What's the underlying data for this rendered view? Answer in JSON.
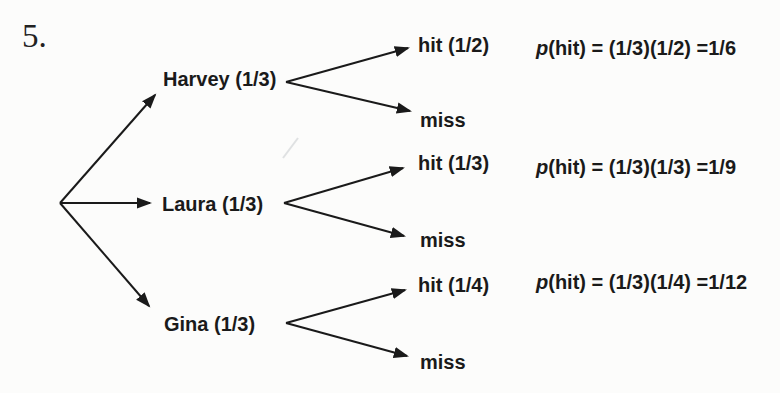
{
  "page": {
    "background": "#fcfcfb",
    "ink": "#1a1a1a",
    "problem_number": "5."
  },
  "tree": {
    "type": "probability-tree",
    "branches": [
      {
        "person": "Harvey (1/3)",
        "person_probability": "1/3",
        "hit": "hit (1/2)",
        "hit_probability": "1/2",
        "miss": "miss",
        "p_symbol": "p",
        "formula": "(hit) = (1/3)(1/2) =1/6",
        "result": "1/6"
      },
      {
        "person": "Laura (1/3)",
        "person_probability": "1/3",
        "hit": "hit (1/3)",
        "hit_probability": "1/3",
        "miss": "miss",
        "p_symbol": "p",
        "formula": "(hit) = (1/3)(1/3) =1/9",
        "result": "1/9"
      },
      {
        "person": "Gina (1/3)",
        "person_probability": "1/3",
        "hit": "hit (1/4)",
        "hit_probability": "1/4",
        "miss": "miss",
        "p_symbol": "p",
        "formula": "(hit) = (1/3)(1/4) =1/12",
        "result": "1/12"
      }
    ]
  }
}
